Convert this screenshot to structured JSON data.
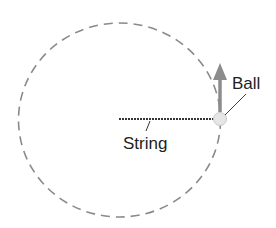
{
  "diagram": {
    "labels": {
      "ball": "Ball",
      "string": "String"
    },
    "colors": {
      "path": "#8a8a8a",
      "string": "#333333",
      "arrow": "#8c8c8c",
      "ball_fill": "#e6e6e6",
      "ball_stroke": "#c8c8c8",
      "text": "#222222"
    },
    "elements": [
      {
        "name": "circular-path",
        "type": "dashed-circle"
      },
      {
        "name": "string",
        "type": "line"
      },
      {
        "name": "ball",
        "type": "circle"
      },
      {
        "name": "velocity-arrow",
        "type": "arrow",
        "direction": "up"
      }
    ]
  }
}
